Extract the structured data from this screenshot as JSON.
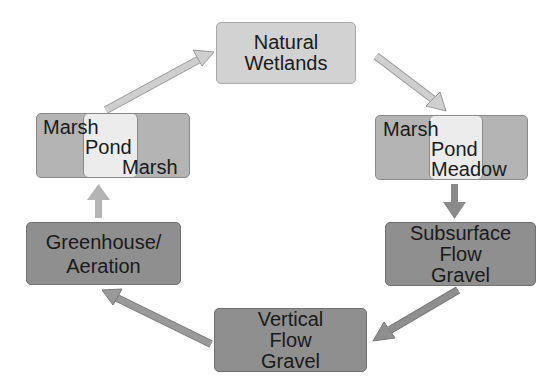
{
  "diagram": {
    "type": "cycle",
    "nodes": [
      {
        "id": "natural_wetlands",
        "lines": [
          "Natural",
          "Wetlands"
        ]
      },
      {
        "id": "marsh_pond_meadow",
        "labels": {
          "left": "Marsh",
          "middle": "Pond",
          "right": "Meadow"
        }
      },
      {
        "id": "subsurface_flow_gravel",
        "lines": [
          "Subsurface",
          "Flow",
          "Gravel"
        ]
      },
      {
        "id": "vertical_flow_gravel",
        "lines": [
          "Vertical",
          "Flow",
          "Gravel"
        ]
      },
      {
        "id": "greenhouse_aeration",
        "lines": [
          "Greenhouse/",
          "Aeration"
        ]
      },
      {
        "id": "marsh_pond_marsh",
        "labels": {
          "left": "Marsh",
          "middle": "Pond",
          "right": "Marsh"
        }
      }
    ],
    "edges": [
      {
        "from": "natural_wetlands",
        "to": "marsh_pond_meadow"
      },
      {
        "from": "marsh_pond_meadow",
        "to": "subsurface_flow_gravel"
      },
      {
        "from": "subsurface_flow_gravel",
        "to": "vertical_flow_gravel"
      },
      {
        "from": "vertical_flow_gravel",
        "to": "greenhouse_aeration"
      },
      {
        "from": "greenhouse_aeration",
        "to": "marsh_pond_marsh"
      },
      {
        "from": "marsh_pond_marsh",
        "to": "natural_wetlands"
      }
    ],
    "colors": {
      "light_box": "#d2d2d2",
      "dark_box": "#8f8f8f",
      "split_outer": "#b4b4b4",
      "split_inner": "#ececec",
      "arrow_light": "#c8c8c8",
      "arrow_dark": "#8a8a8a"
    }
  }
}
